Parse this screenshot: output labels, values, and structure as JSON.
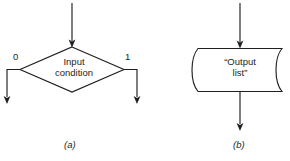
{
  "figure": {
    "title": "",
    "background_color": "#ffffff",
    "line_color": "#231f20"
  },
  "diagram_a": {
    "caption": "(a)",
    "shape_type": "decision-diamond",
    "shape_text_line1": "Input",
    "shape_text_line2": "condition",
    "branch_label_left": "0",
    "branch_label_right": "1",
    "has_input_arrow": true,
    "has_left_output_arrow": true,
    "has_right_output_arrow": true
  },
  "diagram_b": {
    "caption": "(b)",
    "shape_type": "punched-tape",
    "shape_text_line1": "“Output",
    "shape_text_line2": "list”",
    "has_input_arrow": true,
    "has_output_arrow": true
  }
}
